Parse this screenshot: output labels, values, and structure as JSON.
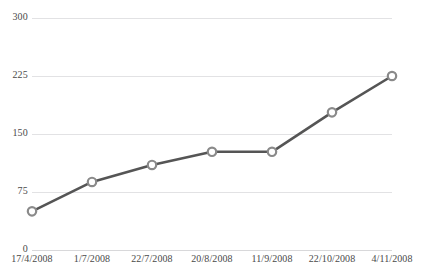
{
  "chart_data": {
    "type": "line",
    "title": "",
    "subtitle": "",
    "xlabel": "",
    "ylabel": "",
    "categories": [
      "17/4/2008",
      "1/7/2008",
      "22/7/2008",
      "20/8/2008",
      "11/9/2008",
      "22/10/2008",
      "4/11/2008"
    ],
    "series": [
      {
        "name": "",
        "values": [
          50,
          88,
          110,
          127,
          127,
          178,
          225
        ]
      }
    ],
    "ylim": [
      0,
      300
    ],
    "yticks": [
      0,
      75,
      150,
      225,
      300
    ],
    "ytick_labels": [
      "0",
      "75",
      "150",
      "225",
      "300"
    ],
    "xtick_labels": [
      "17/4/2008",
      "1/7/2008",
      "22/7/2008",
      "20/8/2008",
      "11/9/2008",
      "22/10/2008",
      "4/11/2008"
    ],
    "grid": true,
    "grid_axis": "y",
    "legend": false,
    "legend_position": "none",
    "marker": "open-circle",
    "colors": {
      "line": "#555555",
      "marker_stroke": "#8a8a8a",
      "marker_fill": "#ffffff",
      "gridline": "#e2e2e4",
      "tick_text": "#4a4a4a",
      "background": "#ffffff"
    }
  }
}
